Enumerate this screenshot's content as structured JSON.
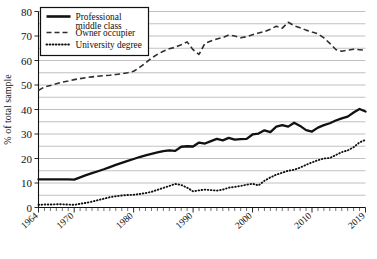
{
  "chart_data": {
    "type": "line",
    "title": "",
    "xlabel": "",
    "ylabel": "% of total sample",
    "xlim": [
      1964,
      2019
    ],
    "ylim": [
      0,
      80
    ],
    "grid": "horizontal-minor-5",
    "legend_position": "top-left",
    "ytick_labels": [
      "0",
      "10",
      "20",
      "30",
      "40",
      "50",
      "60",
      "70",
      "80"
    ],
    "ytick_values": [
      0,
      10,
      20,
      30,
      40,
      50,
      60,
      70,
      80
    ],
    "ytick_minor_step": 5,
    "xtick_labels": [
      "1964",
      "1970",
      "1980",
      "1990",
      "2000",
      "2010",
      "2019"
    ],
    "xtick_values": [
      1964,
      1970,
      1980,
      1990,
      2000,
      2010,
      2019
    ],
    "xtick_minor_step": 1,
    "x": [
      1964,
      1965,
      1966,
      1967,
      1968,
      1969,
      1970,
      1971,
      1972,
      1973,
      1974,
      1975,
      1976,
      1977,
      1978,
      1979,
      1980,
      1981,
      1982,
      1983,
      1984,
      1985,
      1986,
      1987,
      1988,
      1989,
      1990,
      1991,
      1992,
      1993,
      1994,
      1995,
      1996,
      1997,
      1998,
      1999,
      2000,
      2001,
      2002,
      2003,
      2004,
      2005,
      2006,
      2007,
      2008,
      2009,
      2010,
      2011,
      2012,
      2013,
      2014,
      2015,
      2016,
      2017,
      2018,
      2019
    ],
    "series": [
      {
        "name": "Professional middle class",
        "style": "solid",
        "values": [
          11.5,
          11.5,
          11.5,
          11.5,
          11.5,
          11.5,
          11.4,
          12.3,
          13.2,
          14.0,
          14.8,
          15.6,
          16.5,
          17.4,
          18.2,
          19.0,
          19.8,
          20.6,
          21.3,
          21.9,
          22.5,
          23.0,
          23.3,
          23.1,
          24.8,
          25.0,
          24.9,
          26.5,
          26.1,
          27.1,
          28.0,
          27.4,
          28.4,
          27.7,
          27.9,
          28.0,
          29.8,
          30.2,
          31.5,
          30.8,
          33.0,
          33.6,
          33.0,
          34.6,
          33.3,
          31.6,
          31.0,
          32.6,
          33.6,
          34.4,
          35.5,
          36.4,
          37.1,
          38.8,
          40.2,
          39.2
        ]
      },
      {
        "name": "Owner occupier",
        "style": "dashed",
        "values": [
          47.8,
          49.2,
          49.8,
          50.5,
          51.2,
          51.6,
          52.2,
          52.6,
          53.0,
          53.3,
          53.6,
          53.8,
          54.0,
          54.3,
          54.6,
          55.0,
          55.6,
          57.2,
          59.0,
          61.0,
          62.5,
          63.8,
          64.8,
          65.4,
          66.4,
          67.6,
          64.4,
          62.5,
          67.0,
          68.0,
          68.8,
          69.4,
          70.4,
          70.0,
          69.3,
          69.7,
          70.5,
          71.2,
          71.8,
          72.8,
          74.0,
          73.2,
          75.6,
          74.2,
          73.4,
          72.4,
          71.6,
          70.9,
          69.2,
          67.0,
          64.5,
          63.8,
          64.2,
          64.6,
          64.4,
          64.2
        ]
      },
      {
        "name": "University degree",
        "style": "dotted",
        "values": [
          1.1,
          1.2,
          1.2,
          1.3,
          1.3,
          1.2,
          1.1,
          1.5,
          1.9,
          2.4,
          3.0,
          3.6,
          4.2,
          4.6,
          4.9,
          5.1,
          5.2,
          5.5,
          5.9,
          6.4,
          7.2,
          8.0,
          8.8,
          9.6,
          9.2,
          8.1,
          6.6,
          7.0,
          7.3,
          7.1,
          6.9,
          7.3,
          8.1,
          8.4,
          8.8,
          9.3,
          9.7,
          9.0,
          10.9,
          12.3,
          13.4,
          14.2,
          15.0,
          15.4,
          16.3,
          17.4,
          18.4,
          19.3,
          20.0,
          20.2,
          21.4,
          22.6,
          23.3,
          24.6,
          26.6,
          27.6
        ]
      }
    ]
  },
  "legend": {
    "items": [
      {
        "label_line1": "Professional",
        "label_line2": "middle class"
      },
      {
        "label_line1": "Owner occupier",
        "label_line2": ""
      },
      {
        "label_line1": "University degree",
        "label_line2": ""
      }
    ]
  }
}
